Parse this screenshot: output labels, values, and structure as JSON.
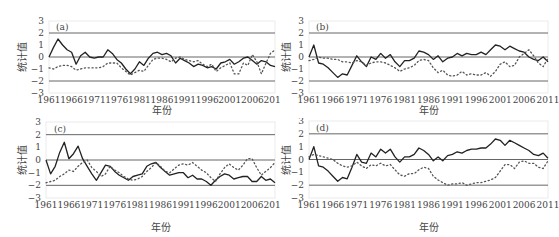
{
  "chart_data": [
    {
      "type": "line",
      "panel_label": "(a)",
      "title": "",
      "xlabel": "年份",
      "ylabel": "统计值",
      "x_ticks": [
        "1961",
        "1966",
        "1971",
        "1976",
        "1981",
        "1986",
        "1991",
        "1996",
        "2001",
        "2006",
        "2011"
      ],
      "y_ticks": [
        3,
        2,
        1,
        0,
        -1,
        -2,
        -3
      ],
      "ylim": [
        -3,
        3
      ],
      "xlim": [
        1961,
        2011
      ],
      "reference_lines": [
        2,
        0,
        -2
      ],
      "grid": false,
      "x": [
        1961,
        1962,
        1963,
        1964,
        1965,
        1966,
        1967,
        1968,
        1969,
        1970,
        1971,
        1972,
        1973,
        1974,
        1975,
        1976,
        1977,
        1978,
        1979,
        1980,
        1981,
        1982,
        1983,
        1984,
        1985,
        1986,
        1987,
        1988,
        1989,
        1990,
        1991,
        1992,
        1993,
        1994,
        1995,
        1996,
        1997,
        1998,
        1999,
        2000,
        2001,
        2002,
        2003,
        2004,
        2005,
        2006,
        2007,
        2008,
        2009,
        2010,
        2011
      ],
      "series": [
        {
          "name": "UF",
          "style": "solid",
          "values": [
            0,
            0.8,
            1.5,
            1.0,
            0.6,
            0.4,
            -0.6,
            0.1,
            0.4,
            0.0,
            -0.1,
            0.0,
            0.0,
            0.6,
            0.3,
            -0.2,
            -0.5,
            -1.0,
            -1.4,
            -1.0,
            -0.4,
            -0.7,
            -0.1,
            0.3,
            0.4,
            0.2,
            0.3,
            0.1,
            -0.5,
            -0.1,
            -0.3,
            -0.5,
            -0.8,
            -0.6,
            -0.7,
            -0.9,
            -0.8,
            -1.0,
            -0.5,
            -0.4,
            -0.2,
            -0.6,
            -0.4,
            -0.1,
            0.0,
            -0.3,
            -0.6,
            -0.3,
            -0.4,
            -0.7,
            -0.8
          ]
        },
        {
          "name": "UB",
          "style": "dotted",
          "values": [
            -0.9,
            -1.0,
            -0.8,
            -0.7,
            -0.7,
            -0.8,
            -1.1,
            -1.0,
            -0.9,
            -0.9,
            -0.9,
            -0.9,
            -0.8,
            -0.5,
            -0.5,
            -0.5,
            -0.9,
            -1.2,
            -1.5,
            -1.3,
            -1.1,
            -1.2,
            -0.7,
            -0.2,
            -0.1,
            -0.1,
            -0.2,
            -0.4,
            -0.1,
            0.0,
            -0.2,
            -0.3,
            -0.4,
            -0.3,
            -0.6,
            -0.8,
            -0.6,
            -1.2,
            -0.9,
            -0.7,
            -0.5,
            -1.4,
            -1.4,
            -0.5,
            -0.7,
            0.2,
            -0.4,
            -1.4,
            -0.5,
            0.3,
            0.6
          ]
        }
      ]
    },
    {
      "type": "line",
      "panel_label": "(b)",
      "title": "",
      "xlabel": "年份",
      "ylabel": "统计值",
      "x_ticks": [
        "1961",
        "1966",
        "1971",
        "1976",
        "1981",
        "1986",
        "1991",
        "1996",
        "2001",
        "2006",
        "2011"
      ],
      "y_ticks": [
        3,
        2,
        1,
        0,
        -1,
        -2,
        -3
      ],
      "ylim": [
        -3,
        3
      ],
      "xlim": [
        1961,
        2011
      ],
      "reference_lines": [
        2,
        0,
        -2
      ],
      "grid": false,
      "x": [
        1961,
        1962,
        1963,
        1964,
        1965,
        1966,
        1967,
        1968,
        1969,
        1970,
        1971,
        1972,
        1973,
        1974,
        1975,
        1976,
        1977,
        1978,
        1979,
        1980,
        1981,
        1982,
        1983,
        1984,
        1985,
        1986,
        1987,
        1988,
        1989,
        1990,
        1991,
        1992,
        1993,
        1994,
        1995,
        1996,
        1997,
        1998,
        1999,
        2000,
        2001,
        2002,
        2003,
        2004,
        2005,
        2006,
        2007,
        2008,
        2009,
        2010,
        2011
      ],
      "series": [
        {
          "name": "UF",
          "style": "solid",
          "values": [
            0,
            1.0,
            -0.5,
            -0.6,
            -0.9,
            -1.3,
            -1.7,
            -1.4,
            -1.5,
            -0.7,
            0.1,
            -0.4,
            -0.8,
            0.0,
            -0.2,
            0.3,
            -0.1,
            0.2,
            -0.4,
            -0.8,
            -0.3,
            -0.3,
            -0.1,
            0.5,
            0.4,
            0.2,
            -0.2,
            0.1,
            -0.4,
            -0.1,
            0.0,
            0.3,
            0.1,
            0.3,
            0.2,
            0.2,
            0.4,
            0.2,
            0.6,
            1.0,
            0.9,
            0.6,
            0.9,
            0.7,
            0.5,
            0.4,
            0.0,
            -0.2,
            -0.3,
            0.0,
            -0.4
          ]
        },
        {
          "name": "UB",
          "style": "dotted",
          "values": [
            -0.3,
            -0.2,
            0.0,
            -0.1,
            -0.1,
            -0.2,
            -0.2,
            -0.4,
            -0.4,
            -0.5,
            -0.3,
            -0.4,
            -0.7,
            -0.5,
            -0.4,
            -0.4,
            -0.5,
            -0.7,
            -0.9,
            -1.2,
            -1.0,
            -0.9,
            -0.7,
            -0.3,
            -0.2,
            -0.3,
            -0.9,
            -1.3,
            -1.1,
            -1.5,
            -1.6,
            -1.5,
            -1.2,
            -1.5,
            -1.4,
            -1.5,
            -1.5,
            -1.3,
            -1.6,
            -1.2,
            -0.6,
            -0.4,
            -0.8,
            -0.7,
            0.0,
            0.3,
            0.6,
            0.1,
            -0.5,
            -0.8,
            -0.1
          ]
        }
      ]
    },
    {
      "type": "line",
      "panel_label": "(c)",
      "title": "",
      "xlabel": "年份",
      "ylabel": "统计值",
      "x_ticks": [
        "1961",
        "1966",
        "1971",
        "1976",
        "1981",
        "1986",
        "1991",
        "1996",
        "2001",
        "2006",
        "2011"
      ],
      "y_ticks": [
        3,
        2,
        1,
        0,
        -1,
        -2,
        -3
      ],
      "ylim": [
        -3,
        3
      ],
      "xlim": [
        1961,
        2011
      ],
      "reference_lines": [
        2,
        0,
        -2
      ],
      "grid": false,
      "x": [
        1961,
        1962,
        1963,
        1964,
        1965,
        1966,
        1967,
        1968,
        1969,
        1970,
        1971,
        1972,
        1973,
        1974,
        1975,
        1976,
        1977,
        1978,
        1979,
        1980,
        1981,
        1982,
        1983,
        1984,
        1985,
        1986,
        1987,
        1988,
        1989,
        1990,
        1991,
        1992,
        1993,
        1994,
        1995,
        1996,
        1997,
        1998,
        1999,
        2000,
        2001,
        2002,
        2003,
        2004,
        2005,
        2006,
        2007,
        2008,
        2009,
        2010,
        2011
      ],
      "series": [
        {
          "name": "UF",
          "style": "solid",
          "values": [
            0,
            -1.1,
            -0.5,
            0.6,
            1.4,
            0.1,
            0.5,
            1.1,
            0.1,
            -0.5,
            -1.1,
            -1.6,
            -1.0,
            -0.4,
            -0.5,
            -0.9,
            -1.2,
            -1.4,
            -1.6,
            -1.3,
            -1.2,
            -1.1,
            -0.5,
            -0.3,
            -0.2,
            -0.6,
            -0.9,
            -1.2,
            -1.1,
            -1.0,
            -1.0,
            -1.4,
            -1.2,
            -1.5,
            -1.5,
            -1.7,
            -2.0,
            -1.6,
            -1.3,
            -1.1,
            -1.2,
            -1.5,
            -1.4,
            -1.3,
            -1.3,
            -1.7,
            -1.7,
            -1.3,
            -1.6,
            -1.5,
            -1.8
          ]
        },
        {
          "name": "UB",
          "style": "dotted",
          "values": [
            -1.8,
            -1.7,
            -1.6,
            -1.3,
            -1.1,
            -0.8,
            -0.9,
            -0.5,
            -0.2,
            0.0,
            -0.6,
            -0.9,
            -1.3,
            -1.1,
            -0.5,
            -0.8,
            -1.0,
            -1.3,
            -1.5,
            -1.6,
            -1.5,
            -1.3,
            -0.9,
            -0.6,
            -0.2,
            -0.5,
            -0.9,
            -1.0,
            -0.7,
            -0.4,
            -0.3,
            -0.4,
            -0.2,
            -0.5,
            -0.8,
            -1.0,
            -1.4,
            -1.7,
            -1.1,
            -0.6,
            -0.3,
            -0.6,
            -0.8,
            -0.4,
            0.1,
            0.1,
            -0.6,
            -1.2,
            -0.9,
            -0.6,
            -0.2
          ]
        }
      ]
    },
    {
      "type": "line",
      "panel_label": "(d)",
      "title": "",
      "xlabel": "年份",
      "ylabel": "统计值",
      "x_ticks": [
        "1961",
        "1966",
        "1971",
        "1976",
        "1981",
        "1986",
        "1991",
        "1996",
        "2001",
        "2006",
        "2011"
      ],
      "y_ticks": [
        3,
        2,
        1,
        0,
        -1,
        -2,
        -3
      ],
      "ylim": [
        -3,
        3
      ],
      "xlim": [
        1961,
        2011
      ],
      "reference_lines": [
        2,
        0,
        -2
      ],
      "grid": false,
      "x": [
        1961,
        1962,
        1963,
        1964,
        1965,
        1966,
        1967,
        1968,
        1969,
        1970,
        1971,
        1972,
        1973,
        1974,
        1975,
        1976,
        1977,
        1978,
        1979,
        1980,
        1981,
        1982,
        1983,
        1984,
        1985,
        1986,
        1987,
        1988,
        1989,
        1990,
        1991,
        1992,
        1993,
        1994,
        1995,
        1996,
        1997,
        1998,
        1999,
        2000,
        2001,
        2002,
        2003,
        2004,
        2005,
        2006,
        2007,
        2008,
        2009,
        2010,
        2011
      ],
      "series": [
        {
          "name": "UF",
          "style": "solid",
          "values": [
            0,
            1.0,
            -0.5,
            -0.6,
            -0.9,
            -1.3,
            -1.7,
            -1.4,
            -1.5,
            -0.6,
            0.4,
            -0.2,
            -0.3,
            0.5,
            0.2,
            0.8,
            0.5,
            0.8,
            0.2,
            -0.2,
            0.2,
            0.2,
            0.4,
            0.9,
            0.7,
            0.4,
            -0.1,
            0.2,
            -0.1,
            0.3,
            0.4,
            0.6,
            0.5,
            0.7,
            0.8,
            0.8,
            0.9,
            0.9,
            1.2,
            1.6,
            1.5,
            1.1,
            1.5,
            1.3,
            1.1,
            0.9,
            0.7,
            0.4,
            0.3,
            0.5,
            0.1
          ]
        },
        {
          "name": "UB",
          "style": "dotted",
          "values": [
            0.2,
            0.4,
            0.3,
            0.2,
            0.1,
            0.0,
            -0.3,
            -0.5,
            -0.6,
            -0.5,
            -0.2,
            -0.5,
            -0.7,
            -0.4,
            -0.5,
            -0.3,
            -0.5,
            -0.4,
            -0.8,
            -1.2,
            -1.3,
            -1.1,
            -1.1,
            -0.8,
            -0.6,
            -0.7,
            -1.3,
            -1.6,
            -1.8,
            -2.0,
            -1.9,
            -1.9,
            -1.8,
            -2.0,
            -1.9,
            -1.8,
            -1.8,
            -1.7,
            -1.6,
            -1.4,
            -0.9,
            -0.4,
            -0.4,
            -0.7,
            -0.2,
            -0.1,
            -0.3,
            -0.3,
            -0.6,
            -0.7,
            -0.1
          ]
        }
      ]
    }
  ],
  "labels": {
    "xlabel": "年份",
    "ylabel": "统计值"
  }
}
